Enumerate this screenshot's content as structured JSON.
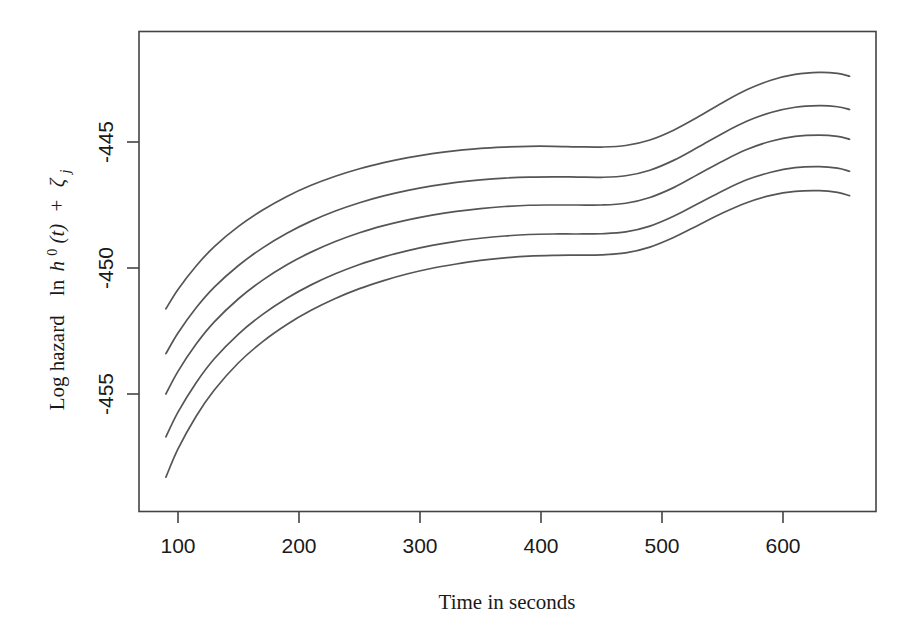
{
  "chart_data": {
    "type": "line",
    "title": "",
    "xlabel": "Time in seconds",
    "ylabel": "Log hazard  ln h0(t) + zeta_j",
    "ylabel_parts": {
      "prefix": "Log hazard",
      "math_ln": "ln",
      "math_h": "h",
      "math_h_sup": "0",
      "math_t": "(t)",
      "math_plus": "+",
      "math_zeta": "ζ",
      "math_zeta_sub": "j"
    },
    "xticks": [
      100,
      200,
      300,
      400,
      500,
      600
    ],
    "xtick_labels": [
      "100",
      "200",
      "300",
      "400",
      "500",
      "600"
    ],
    "yticks": [
      -445,
      -450,
      -455
    ],
    "ytick_labels": [
      "-445",
      "-450",
      "-455"
    ],
    "xlim": [
      78,
      688
    ],
    "ylim": [
      -458.6,
      -442.8
    ],
    "grid": false,
    "legend": null,
    "line_color": "#555555",
    "axis_color": "#444444",
    "background_color": "#ffffff",
    "n_series": 5,
    "x": [
      90,
      100,
      115,
      130,
      150,
      170,
      190,
      210,
      230,
      250,
      270,
      290,
      310,
      330,
      350,
      370,
      390,
      410,
      430,
      450,
      470,
      490,
      510,
      530,
      550,
      570,
      590,
      610,
      630,
      645,
      655
    ],
    "series": [
      {
        "name": "curve-1",
        "values": [
          -451.62,
          -450.85,
          -449.92,
          -449.15,
          -448.35,
          -447.7,
          -447.16,
          -446.72,
          -446.36,
          -446.06,
          -445.82,
          -445.62,
          -445.46,
          -445.34,
          -445.25,
          -445.2,
          -445.17,
          -445.17,
          -445.19,
          -445.2,
          -445.14,
          -444.92,
          -444.52,
          -444.0,
          -443.44,
          -442.93,
          -442.55,
          -442.32,
          -442.24,
          -442.28,
          -442.39
        ]
      },
      {
        "name": "curve-2",
        "values": [
          -453.4,
          -452.58,
          -451.58,
          -450.76,
          -449.9,
          -449.2,
          -448.62,
          -448.14,
          -447.74,
          -447.41,
          -447.14,
          -446.92,
          -446.74,
          -446.6,
          -446.5,
          -446.43,
          -446.39,
          -446.38,
          -446.39,
          -446.4,
          -446.34,
          -446.12,
          -445.72,
          -445.2,
          -444.66,
          -444.18,
          -443.83,
          -443.62,
          -443.56,
          -443.6,
          -443.71
        ]
      },
      {
        "name": "curve-3",
        "values": [
          -455.0,
          -454.1,
          -453.02,
          -452.14,
          -451.22,
          -450.48,
          -449.87,
          -449.37,
          -448.95,
          -448.6,
          -448.32,
          -448.09,
          -447.9,
          -447.75,
          -447.64,
          -447.56,
          -447.51,
          -447.5,
          -447.5,
          -447.5,
          -447.43,
          -447.2,
          -446.8,
          -446.28,
          -445.76,
          -445.3,
          -444.97,
          -444.78,
          -444.73,
          -444.78,
          -444.89
        ]
      },
      {
        "name": "curve-4",
        "values": [
          -456.7,
          -455.72,
          -454.55,
          -453.6,
          -452.62,
          -451.84,
          -451.2,
          -450.67,
          -450.23,
          -449.86,
          -449.56,
          -449.31,
          -449.1,
          -448.94,
          -448.82,
          -448.73,
          -448.67,
          -448.65,
          -448.65,
          -448.64,
          -448.57,
          -448.34,
          -447.94,
          -447.44,
          -446.94,
          -446.5,
          -446.2,
          -446.02,
          -445.98,
          -446.04,
          -446.16
        ]
      },
      {
        "name": "curve-5",
        "values": [
          -458.3,
          -457.18,
          -455.88,
          -454.84,
          -453.76,
          -452.92,
          -452.24,
          -451.68,
          -451.21,
          -450.82,
          -450.5,
          -450.23,
          -450.01,
          -449.84,
          -449.7,
          -449.6,
          -449.53,
          -449.5,
          -449.49,
          -449.48,
          -449.4,
          -449.17,
          -448.78,
          -448.3,
          -447.82,
          -447.41,
          -447.12,
          -446.96,
          -446.93,
          -447.0,
          -447.13
        ]
      }
    ]
  }
}
